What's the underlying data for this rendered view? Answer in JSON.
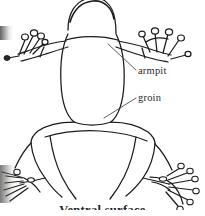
{
  "figure": {
    "caption": "Ventral surface",
    "background_color": "#ffffff",
    "ink_color": "#1a1a1a",
    "leader_color": "#4a4a4a",
    "text_color": "#2b2b2b"
  },
  "labels": {
    "armpit": "armpit",
    "groin": "groin"
  },
  "annotations": [
    {
      "name": "armpit",
      "label": "armpit",
      "text_x": 138,
      "text_y": 66,
      "leader_from_x": 136,
      "leader_from_y": 70,
      "leader_to_x": 108,
      "leader_to_y": 44
    },
    {
      "name": "groin",
      "label": "groin",
      "text_x": 138,
      "text_y": 93,
      "leader_from_x": 136,
      "leader_from_y": 98,
      "leader_to_x": 104,
      "leader_to_y": 118
    }
  ],
  "anatomy_parts": [
    "head",
    "torso",
    "left-forelimb",
    "right-forelimb",
    "left-hand",
    "right-hand",
    "left-hindlimb",
    "right-hindlimb",
    "left-foot",
    "right-foot",
    "armpit",
    "groin"
  ]
}
